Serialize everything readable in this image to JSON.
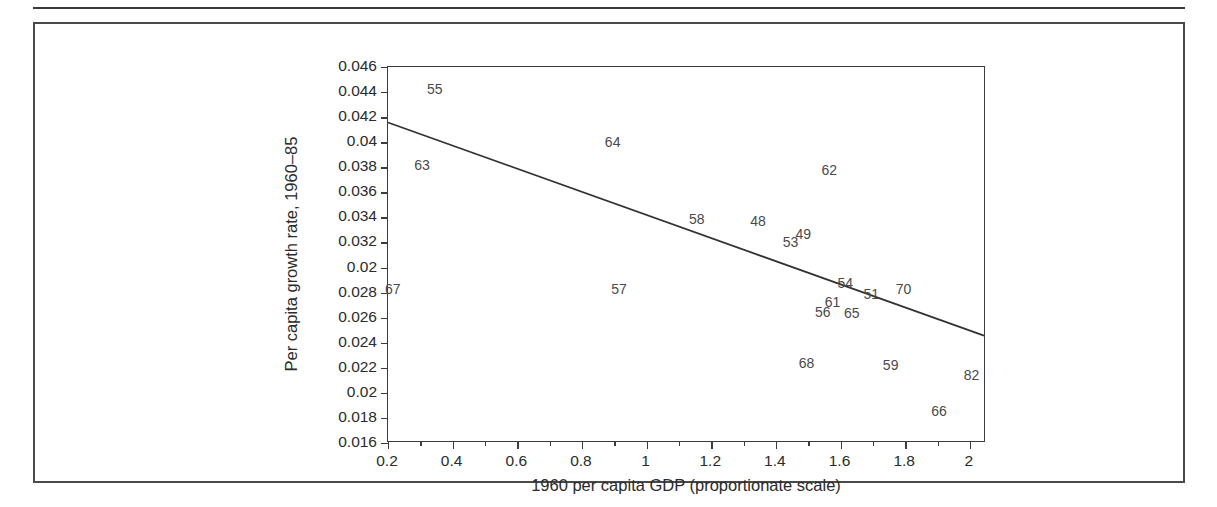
{
  "chart_data": {
    "type": "scatter",
    "title": "",
    "xlabel": "1960 per capita GDP (proportionate scale)",
    "ylabel": "Per capita growth rate, 1960–85",
    "xlim": [
      0.2,
      2.05
    ],
    "ylim": [
      0.016,
      0.046
    ],
    "grid": false,
    "legend": null,
    "point_marker": "text-label",
    "xticks": [
      {
        "value": 0.2,
        "label": "0.2"
      },
      {
        "value": 0.4,
        "label": "0.4"
      },
      {
        "value": 0.6,
        "label": "0.6"
      },
      {
        "value": 0.8,
        "label": "0.8"
      },
      {
        "value": 1.0,
        "label": "1"
      },
      {
        "value": 1.2,
        "label": "1.2"
      },
      {
        "value": 1.4,
        "label": "1.4"
      },
      {
        "value": 1.6,
        "label": "1.6"
      },
      {
        "value": 1.8,
        "label": "1.8"
      },
      {
        "value": 2.0,
        "label": "2"
      }
    ],
    "xticks_minor": [
      0.3,
      0.5,
      0.7,
      0.9,
      1.1,
      1.3,
      1.5,
      1.7,
      1.9
    ],
    "yticks": [
      {
        "value": 0.046,
        "label": "0.046"
      },
      {
        "value": 0.044,
        "label": "0.044"
      },
      {
        "value": 0.042,
        "label": "0.042"
      },
      {
        "value": 0.04,
        "label": "0.04"
      },
      {
        "value": 0.038,
        "label": "0.038"
      },
      {
        "value": 0.036,
        "label": "0.036"
      },
      {
        "value": 0.034,
        "label": "0.034"
      },
      {
        "value": 0.032,
        "label": "0.032"
      },
      {
        "value": 0.03,
        "label": "0.02"
      },
      {
        "value": 0.028,
        "label": "0.028"
      },
      {
        "value": 0.026,
        "label": "0.026"
      },
      {
        "value": 0.024,
        "label": "0.024"
      },
      {
        "value": 0.022,
        "label": "0.022"
      },
      {
        "value": 0.02,
        "label": "0.02"
      },
      {
        "value": 0.018,
        "label": "0.018"
      },
      {
        "value": 0.016,
        "label": "0.016"
      }
    ],
    "points": [
      {
        "label": "55",
        "x": 0.345,
        "y": 0.04425
      },
      {
        "label": "63",
        "x": 0.305,
        "y": 0.03815
      },
      {
        "label": "64",
        "x": 0.895,
        "y": 0.04005
      },
      {
        "label": "62",
        "x": 1.565,
        "y": 0.03775
      },
      {
        "label": "58",
        "x": 1.155,
        "y": 0.03385
      },
      {
        "label": "48",
        "x": 1.345,
        "y": 0.03375
      },
      {
        "label": "49",
        "x": 1.485,
        "y": 0.03265
      },
      {
        "label": "53",
        "x": 1.445,
        "y": 0.03205
      },
      {
        "label": "67",
        "x": 0.215,
        "y": 0.02825
      },
      {
        "label": "57",
        "x": 0.915,
        "y": 0.02825
      },
      {
        "label": "54",
        "x": 1.615,
        "y": 0.02875
      },
      {
        "label": "51",
        "x": 1.695,
        "y": 0.02785
      },
      {
        "label": "70",
        "x": 1.795,
        "y": 0.02825
      },
      {
        "label": "61",
        "x": 1.575,
        "y": 0.02725
      },
      {
        "label": "56",
        "x": 1.545,
        "y": 0.02645
      },
      {
        "label": "65",
        "x": 1.635,
        "y": 0.02635
      },
      {
        "label": "68",
        "x": 1.495,
        "y": 0.02235
      },
      {
        "label": "59",
        "x": 1.755,
        "y": 0.02225
      },
      {
        "label": "82",
        "x": 2.005,
        "y": 0.02145
      },
      {
        "label": "66",
        "x": 1.905,
        "y": 0.01855
      }
    ],
    "fit_line": {
      "name": "regression-line",
      "x0": 0.2,
      "y0": 0.04155,
      "x1": 2.05,
      "y1": 0.02445
    }
  },
  "colors": {
    "axis": "#3c3c3c",
    "frame": "#4a4a4a",
    "label_text": "#4a4a4a",
    "tick_text": "#2b2b2b",
    "line": "#333333",
    "background": "#ffffff"
  }
}
